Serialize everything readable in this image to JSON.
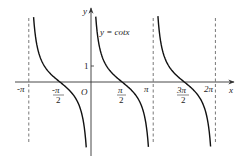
{
  "chart_data": {
    "type": "line",
    "title": "",
    "function_label": "y = cotx",
    "xlabel": "x",
    "ylabel": "y",
    "origin_label": "O",
    "x_tick_labels": [
      {
        "value": -3.14159,
        "text": "-π"
      },
      {
        "value": -1.5708,
        "text_num": "-π",
        "text_den": "2"
      },
      {
        "value": 1.5708,
        "text_num": "π",
        "text_den": "2"
      },
      {
        "value": 3.14159,
        "text": "π"
      },
      {
        "value": 4.7124,
        "text_num": "3π",
        "text_den": "2"
      },
      {
        "value": 6.28318,
        "text": "2π"
      }
    ],
    "y_tick_labels": [
      {
        "value": 1,
        "text": "1"
      }
    ],
    "asymptotes_dashed": [
      -3.14159,
      3.14159,
      6.28318
    ],
    "xlim": [
      -3.6,
      7.2
    ],
    "ylim": [
      -4.5,
      4.7
    ],
    "grid": false,
    "series": [
      {
        "name": "cot x branch (-π,0)",
        "x_range": [
          -2.9,
          -0.24
        ]
      },
      {
        "name": "cot x branch (0,π)",
        "x_range": [
          0.24,
          2.9
        ]
      },
      {
        "name": "cot x branch (π,2π)",
        "x_range": [
          3.38,
          6.04
        ]
      }
    ],
    "colors": {
      "curve": "#111111",
      "axis": "#333333",
      "dashed": "#555555"
    }
  }
}
